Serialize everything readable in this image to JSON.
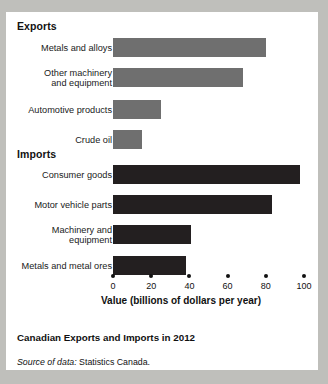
{
  "card": {
    "exports_heading": "Exports",
    "imports_heading": "Imports",
    "caption_title": "Canadian Exports and Imports in 2012",
    "source_lead": "Source of data:",
    "source_text": " Statistics Canada."
  },
  "colors": {
    "exports_bar": "#6f6f6f",
    "imports_bar": "#231f20",
    "text": "#111111",
    "card_background": "#ffffff",
    "page_background": "#bfbfbb"
  },
  "chart_data": {
    "type": "bar",
    "orientation": "horizontal",
    "title": "Canadian Exports and Imports in 2012",
    "xlabel": "Value (billions of dollars per year)",
    "ylabel": "",
    "xlim": [
      0,
      100
    ],
    "xticks": [
      0,
      20,
      40,
      60,
      80,
      100
    ],
    "xtick_labels": [
      "0",
      "20",
      "40",
      "60",
      "80",
      "100"
    ],
    "grid": false,
    "legend": "none",
    "groups": [
      {
        "name": "Exports",
        "color": "#6f6f6f",
        "categories": [
          "Metals and alloys",
          "Other machinery\nand equipment",
          "Automotive products",
          "Crude oil"
        ],
        "values": [
          80,
          68,
          25,
          15
        ]
      },
      {
        "name": "Imports",
        "color": "#231f20",
        "categories": [
          "Consumer goods",
          "Motor vehicle parts",
          "Machinery and\nequipment",
          "Metals and metal ores"
        ],
        "values": [
          98,
          83,
          41,
          38
        ]
      }
    ],
    "rows": [
      {
        "label": "Metals and alloys",
        "value": 80,
        "group": "Exports",
        "top": 26
      },
      {
        "label": "Other machinery\nand equipment",
        "value": 68,
        "group": "Exports",
        "top": 56
      },
      {
        "label": "Automotive products",
        "value": 25,
        "group": "Exports",
        "top": 88
      },
      {
        "label": "Crude oil",
        "value": 15,
        "group": "Exports",
        "top": 118
      },
      {
        "label": "Consumer goods",
        "value": 98,
        "group": "Imports",
        "top": 153
      },
      {
        "label": "Motor vehicle parts",
        "value": 83,
        "group": "Imports",
        "top": 183
      },
      {
        "label": "Machinery and\nequipment",
        "value": 41,
        "group": "Imports",
        "top": 213
      },
      {
        "label": "Metals and metal ores",
        "value": 38,
        "group": "Imports",
        "top": 244
      }
    ]
  },
  "axis": {
    "title": "Value (billions of dollars per year)",
    "ticks": [
      {
        "label": "0",
        "value": 0
      },
      {
        "label": "20",
        "value": 20
      },
      {
        "label": "40",
        "value": 40
      },
      {
        "label": "60",
        "value": 60
      },
      {
        "label": "80",
        "value": 80
      },
      {
        "label": "100",
        "value": 100
      }
    ]
  }
}
